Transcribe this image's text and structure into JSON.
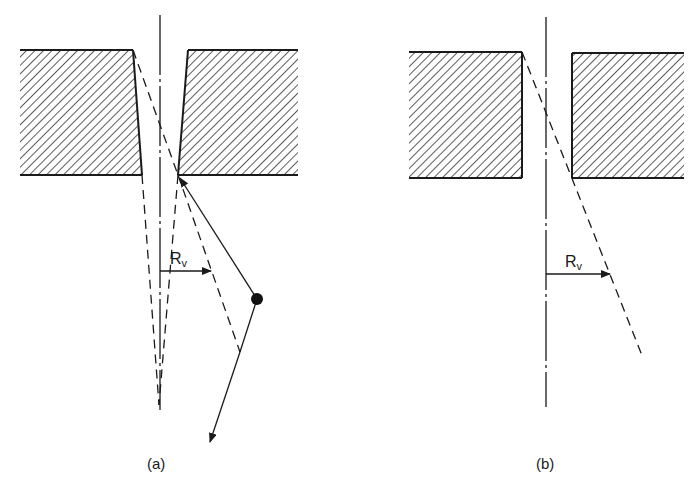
{
  "figure": {
    "panels": [
      {
        "id": "a",
        "caption": "(a)",
        "radius_label": "R",
        "radius_subscript": "v",
        "elements": [
          "tapered hole in hatched wall",
          "dash-dot centerline",
          "dashed projection lines converging below hole",
          "particle trajectory with reflection point (dot)",
          "R_v arrow"
        ]
      },
      {
        "id": "b",
        "caption": "(b)",
        "radius_label": "R",
        "radius_subscript": "v",
        "elements": [
          "straight hole in hatched wall",
          "dash-dot centerline",
          "dashed diagonal line through hole",
          "R_v arrow"
        ]
      }
    ]
  },
  "colors": {
    "line": "#1a1a1a",
    "hatch": "#333333",
    "background": "#ffffff"
  }
}
